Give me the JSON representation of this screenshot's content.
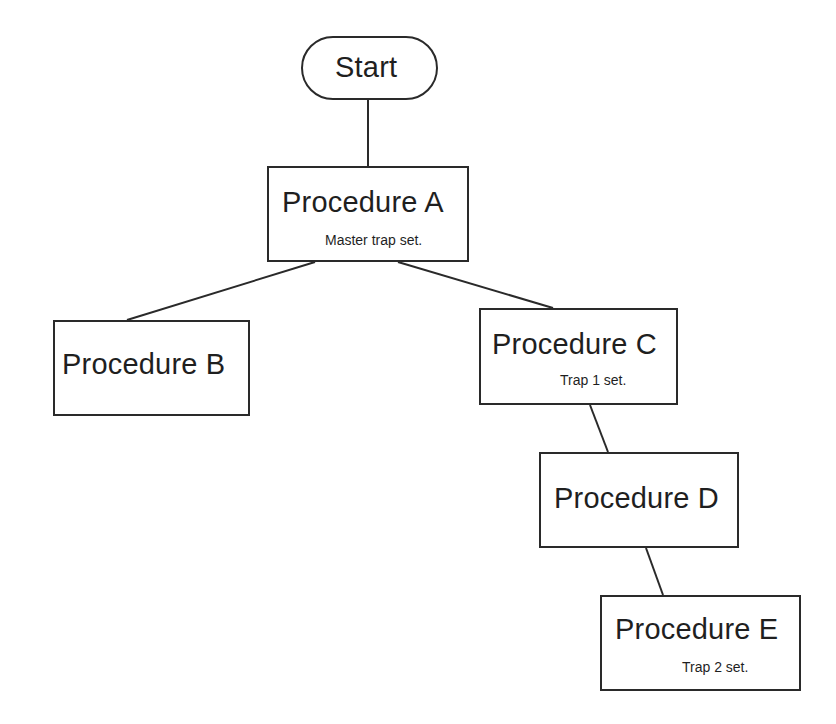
{
  "diagram": {
    "type": "flowchart-tree",
    "nodes": [
      {
        "id": "start",
        "label": "Start",
        "shape": "terminator"
      },
      {
        "id": "A",
        "label": "Procedure A",
        "note": "Master trap set."
      },
      {
        "id": "B",
        "label": "Procedure B"
      },
      {
        "id": "C",
        "label": "Procedure C",
        "note": "Trap 1 set."
      },
      {
        "id": "D",
        "label": "Procedure D"
      },
      {
        "id": "E",
        "label": "Procedure E",
        "note": "Trap 2 set."
      }
    ],
    "edges": [
      {
        "from": "start",
        "to": "A"
      },
      {
        "from": "A",
        "to": "B"
      },
      {
        "from": "A",
        "to": "C"
      },
      {
        "from": "C",
        "to": "D"
      },
      {
        "from": "D",
        "to": "E"
      }
    ]
  }
}
